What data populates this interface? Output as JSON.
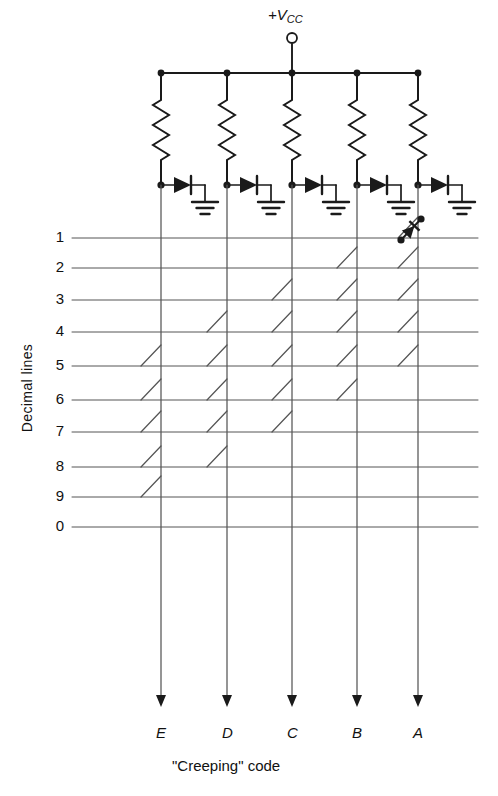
{
  "figure": {
    "supply_label": "+V",
    "supply_sub": "CC",
    "supply_terminal": "open-circle",
    "axis_label": "Decimal lines",
    "code_label": "\"Creeping\" code",
    "line_color": "#1a1a1a",
    "grid_color": "#555555",
    "background": "#ffffff"
  },
  "columns": [
    {
      "id": "E",
      "label": "E",
      "x": 161
    },
    {
      "id": "D",
      "label": "D",
      "x": 227
    },
    {
      "id": "C",
      "label": "C",
      "x": 292
    },
    {
      "id": "B",
      "label": "B",
      "x": 357
    },
    {
      "id": "A",
      "label": "A",
      "x": 418
    }
  ],
  "rows": [
    {
      "label": "1",
      "y": 238,
      "connections": [
        "A"
      ]
    },
    {
      "label": "2",
      "y": 268,
      "connections": [
        "B",
        "A"
      ]
    },
    {
      "label": "3",
      "y": 300,
      "connections": [
        "C",
        "B",
        "A"
      ]
    },
    {
      "label": "4",
      "y": 332,
      "connections": [
        "D",
        "C",
        "B",
        "A"
      ]
    },
    {
      "label": "5",
      "y": 366,
      "connections": [
        "E",
        "D",
        "C",
        "B",
        "A"
      ]
    },
    {
      "label": "6",
      "y": 400,
      "connections": [
        "E",
        "D",
        "C",
        "B"
      ]
    },
    {
      "label": "7",
      "y": 432,
      "connections": [
        "E",
        "D",
        "C"
      ]
    },
    {
      "label": "8",
      "y": 467,
      "connections": [
        "E",
        "D"
      ]
    },
    {
      "label": "9",
      "y": 497,
      "connections": [
        "E"
      ]
    },
    {
      "label": "0",
      "y": 527,
      "connections": []
    }
  ],
  "supply_rail": {
    "y": 73,
    "x_start": 161,
    "x_end": 418,
    "terminal_x": 292,
    "terminal_y": 38
  },
  "resistors": {
    "top": 100,
    "bottom": 160,
    "count": 5
  },
  "diode_row": {
    "y": 185,
    "count": 5
  },
  "detail_diode": {
    "row": "1",
    "column": "A",
    "note": "crosspoint-diode-detail"
  },
  "output_arrows": {
    "tip_y": 707,
    "label_y": 735
  }
}
